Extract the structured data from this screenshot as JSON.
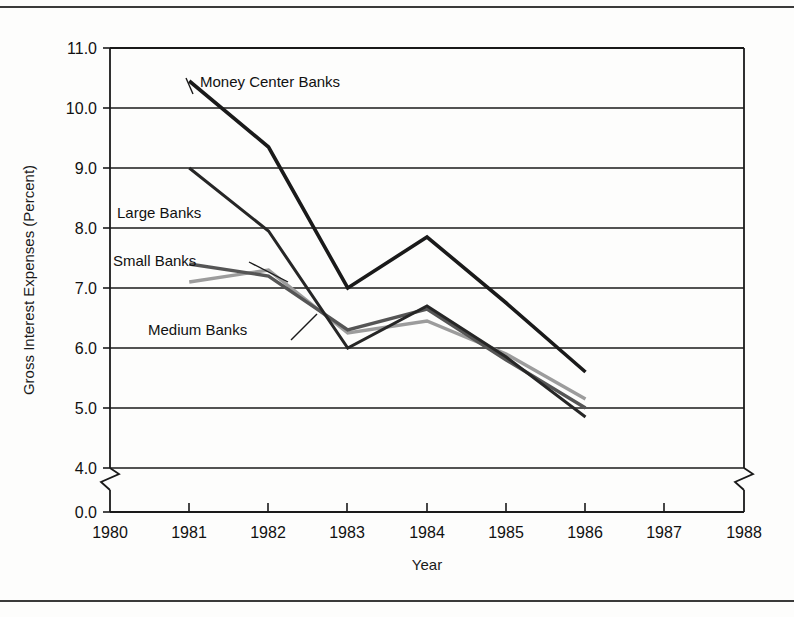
{
  "chart_data": {
    "type": "line",
    "title": "",
    "xlabel": "Year",
    "ylabel": "Gross Interest Expenses (Percent)",
    "x": [
      1981,
      1982,
      1983,
      1984,
      1985,
      1986
    ],
    "xticks": [
      "1980",
      "1981",
      "1982",
      "1983",
      "1984",
      "1985",
      "1986",
      "1987",
      "1988"
    ],
    "yticks": [
      "0.0",
      "4.0",
      "5.0",
      "6.0",
      "7.0",
      "8.0",
      "9.0",
      "10.0",
      "11.0"
    ],
    "xlim": [
      1980,
      1988
    ],
    "ylim": [
      4.0,
      11.0
    ],
    "y_axis_break": {
      "from": "0.0",
      "to": "4.0"
    },
    "x_axis_break_right": true,
    "grid": "horizontal",
    "legend_position": "inline-labels",
    "series": [
      {
        "name": "Money Center Banks",
        "color": "#1a1a1a",
        "width": 3.6,
        "values": [
          10.45,
          9.35,
          7.0,
          7.85,
          6.75,
          5.6
        ]
      },
      {
        "name": "Large Banks",
        "color": "#262626",
        "width": 3.0,
        "values": [
          9.0,
          7.95,
          6.0,
          6.7,
          5.85,
          4.85
        ]
      },
      {
        "name": "Small Banks",
        "color": "#555555",
        "width": 3.4,
        "values": [
          7.4,
          7.2,
          6.3,
          6.65,
          5.8,
          5.0
        ]
      },
      {
        "name": "Medium Banks",
        "color": "#9c9c9c",
        "width": 3.4,
        "values": [
          7.1,
          7.3,
          6.25,
          6.45,
          5.9,
          5.15
        ]
      }
    ],
    "annotations": [
      {
        "text": "Money Center Banks",
        "x": 200,
        "y": 77
      },
      {
        "text": "Large Banks",
        "x": 117,
        "y": 208
      },
      {
        "text": "Small Banks",
        "x": 113,
        "y": 256
      },
      {
        "text": "Medium Banks",
        "x": 148,
        "y": 325
      }
    ]
  }
}
